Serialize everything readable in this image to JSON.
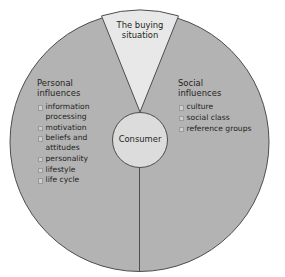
{
  "figure": {
    "colors": {
      "outer_fill": "#b3b3b3",
      "wedge_fill": "#e8e8e8",
      "center_fill": "#dcdcdc",
      "stroke": "#4d4d4d",
      "text": "#231f20",
      "bullet_fill": "#cfcfcf",
      "background": "#ffffff"
    },
    "geometry": {
      "outer_circle": {
        "cx": 139.5,
        "cy": 142,
        "r": 130
      },
      "center_circle": {
        "cx": 140,
        "cy": 140,
        "r": 28
      },
      "wedge_apex": {
        "x": 140,
        "y": 112
      },
      "divider_line": {
        "x": 139.5,
        "y1": 168,
        "y2": 272
      }
    }
  },
  "wedge": {
    "label_line1": "The buying",
    "label_line2": "situation"
  },
  "center": {
    "label": "Consumer"
  },
  "left_sector": {
    "heading_line1": "Personal",
    "heading_line2": "influences",
    "items": [
      {
        "line1": "information",
        "line2": "processing"
      },
      {
        "line1": "motivation",
        "line2": ""
      },
      {
        "line1": "beliefs and",
        "line2": "attitudes"
      },
      {
        "line1": "personality",
        "line2": ""
      },
      {
        "line1": "lifestyle",
        "line2": ""
      },
      {
        "line1": "life cycle",
        "line2": ""
      }
    ]
  },
  "right_sector": {
    "heading_line1": "Social",
    "heading_line2": "influences",
    "items": [
      {
        "line1": "culture",
        "line2": ""
      },
      {
        "line1": "social class",
        "line2": ""
      },
      {
        "line1": "reference groups",
        "line2": ""
      }
    ]
  }
}
